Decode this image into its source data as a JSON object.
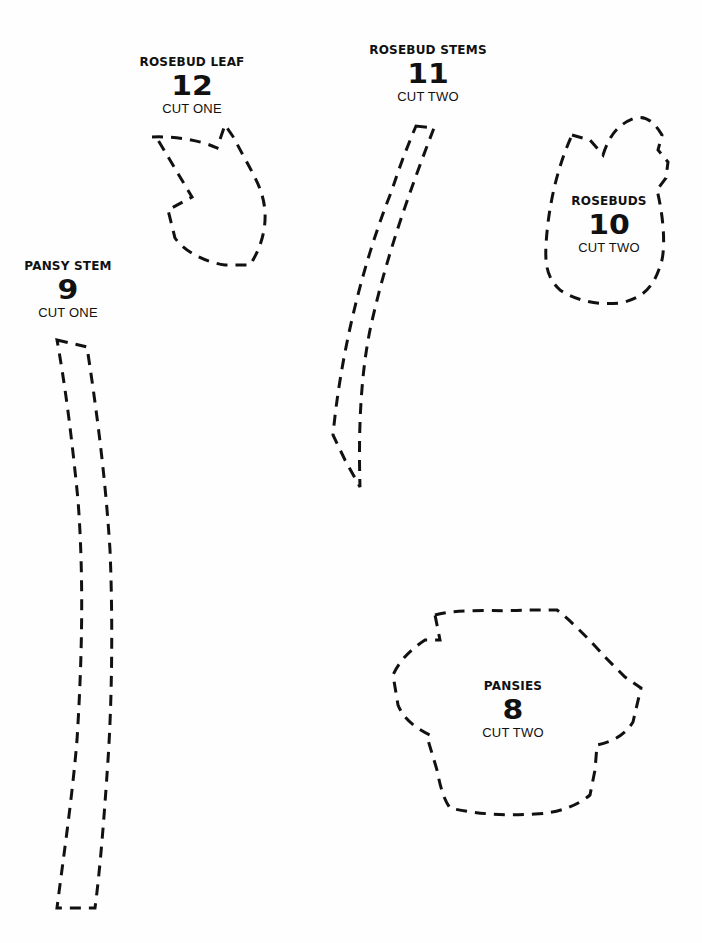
{
  "pieces": [
    {
      "id": "rosebud-leaf",
      "title": "ROSEBUD LEAF",
      "number": "12",
      "instruction": "CUT ONE"
    },
    {
      "id": "rosebud-stems",
      "title": "ROSEBUD STEMS",
      "number": "11",
      "instruction": "CUT TWO"
    },
    {
      "id": "rosebuds",
      "title": "ROSEBUDS",
      "number": "10",
      "instruction": "CUT TWO"
    },
    {
      "id": "pansy-stem",
      "title": "PANSY STEM",
      "number": "9",
      "instruction": "CUT ONE"
    },
    {
      "id": "pansies",
      "title": "PANSIES",
      "number": "8",
      "instruction": "CUT TWO"
    }
  ],
  "style": {
    "ink_color": "#111111",
    "paper_color": "#fefefe",
    "outline": "dashed"
  }
}
